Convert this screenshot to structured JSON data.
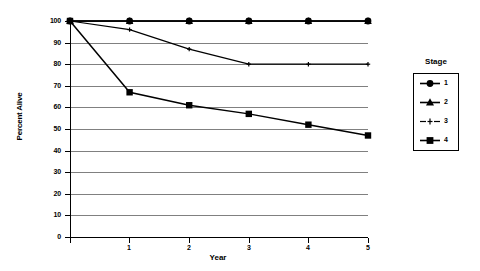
{
  "chart_data": {
    "type": "line",
    "title": "",
    "xlabel": "Year",
    "ylabel": "Percent Alive",
    "x": [
      0,
      1,
      2,
      3,
      4,
      5
    ],
    "xlim": [
      0,
      5
    ],
    "ylim": [
      0,
      100
    ],
    "xticks": [
      "0",
      "1",
      "2",
      "3",
      "4",
      "5"
    ],
    "yticks": [
      "0",
      "10",
      "20",
      "30",
      "40",
      "50",
      "60",
      "70",
      "80",
      "90",
      "100"
    ],
    "grid": true,
    "legend_position": "right",
    "legend_title": "Stage",
    "series": [
      {
        "name": "1",
        "marker": "circle",
        "values": [
          100,
          100,
          100,
          100,
          100,
          100
        ]
      },
      {
        "name": "2",
        "marker": "triangle",
        "values": [
          100,
          100,
          100,
          100,
          100,
          100
        ]
      },
      {
        "name": "3",
        "marker": "cross",
        "values": [
          100,
          96,
          87,
          80,
          80,
          80
        ]
      },
      {
        "name": "4",
        "marker": "square",
        "values": [
          100,
          67,
          61,
          57,
          52,
          47
        ]
      }
    ]
  },
  "axes": {
    "y_label_text": "Percent Alive",
    "x_label_text": "Year",
    "y_tick_labels": [
      "100",
      "90",
      "80",
      "70",
      "60",
      "50",
      "40",
      "30",
      "20",
      "10",
      "0"
    ],
    "x_tick_labels": [
      "0",
      "1",
      "2",
      "3",
      "4",
      "5"
    ]
  },
  "legend": {
    "title": "Stage",
    "items": [
      {
        "label": "1",
        "marker": "circle-marker"
      },
      {
        "label": "2",
        "marker": "triangle-marker"
      },
      {
        "label": "3",
        "marker": "cross-marker"
      },
      {
        "label": "4",
        "marker": "square-marker"
      }
    ]
  },
  "colors": {
    "line": "#000000",
    "grid": "#808080",
    "axis": "#000000",
    "background": "#ffffff"
  }
}
